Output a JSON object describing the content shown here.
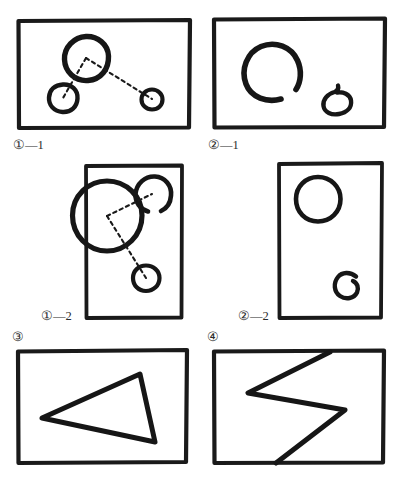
{
  "figure": {
    "title": "",
    "background_color": "#ffffff",
    "ink_color": "#1a1a1a",
    "panels": [
      {
        "id": "panel-1-1",
        "label": "①—1",
        "label_position": "below-left",
        "frame": {
          "x": 18,
          "y": 20,
          "width": 172,
          "height": 108,
          "orientation": "landscape"
        },
        "shapes": [
          {
            "kind": "circle",
            "name": "large-circle",
            "cx": 86,
            "cy": 58,
            "r": 22,
            "stroke_width": 5
          },
          {
            "kind": "circle",
            "name": "small-circle-left",
            "cx": 63,
            "cy": 98,
            "r": 14,
            "stroke_width": 4
          },
          {
            "kind": "circle",
            "name": "small-circle-right",
            "cx": 152,
            "cy": 99,
            "r": 10,
            "stroke_width": 4
          }
        ],
        "connectors": [
          {
            "kind": "dashed-line",
            "name": "connector-large-to-left",
            "x1": 86,
            "y1": 58,
            "x2": 63,
            "y2": 98
          },
          {
            "kind": "dashed-line",
            "name": "connector-large-to-right",
            "x1": 86,
            "y1": 58,
            "x2": 152,
            "y2": 99
          }
        ]
      },
      {
        "id": "panel-2-1",
        "label": "②—1",
        "label_position": "below-left",
        "frame": {
          "x": 213,
          "y": 18,
          "width": 172,
          "height": 110,
          "orientation": "landscape"
        },
        "shapes": [
          {
            "kind": "circle",
            "name": "large-open-circle",
            "cx": 272,
            "cy": 72,
            "r": 27,
            "stroke_width": 5,
            "open_gap_deg": 30
          },
          {
            "kind": "circle",
            "name": "small-open-circle",
            "cx": 337,
            "cy": 99,
            "r": 14,
            "stroke_width": 4,
            "open_gap_deg": 26
          }
        ],
        "connectors": []
      },
      {
        "id": "panel-1-2",
        "label": "①—2",
        "label_position": "bottom-left-outside",
        "frame": {
          "x": 85,
          "y": 165,
          "width": 97,
          "height": 153,
          "orientation": "portrait"
        },
        "shapes": [
          {
            "kind": "circle",
            "name": "large-circle-overlapping-edge",
            "cx": 107,
            "cy": 216,
            "r": 35,
            "stroke_width": 5
          },
          {
            "kind": "circle",
            "name": "upper-right-circle",
            "cx": 152,
            "cy": 194,
            "r": 18,
            "stroke_width": 4,
            "open_gap_deg": 30
          },
          {
            "kind": "circle",
            "name": "lower-right-circle",
            "cx": 146,
            "cy": 278,
            "r": 13,
            "stroke_width": 4
          }
        ],
        "connectors": [
          {
            "kind": "dashed-line",
            "name": "connector-large-to-upper",
            "x1": 107,
            "y1": 216,
            "x2": 152,
            "y2": 194
          },
          {
            "kind": "dashed-line",
            "name": "connector-large-to-lower",
            "x1": 107,
            "y1": 216,
            "x2": 146,
            "y2": 278
          }
        ]
      },
      {
        "id": "panel-2-2",
        "label": "②—2",
        "label_position": "bottom-left-outside",
        "frame": {
          "x": 278,
          "y": 163,
          "width": 104,
          "height": 155,
          "orientation": "portrait"
        },
        "shapes": [
          {
            "kind": "circle",
            "name": "upper-circle",
            "cx": 318,
            "cy": 199,
            "r": 22,
            "stroke_width": 4
          },
          {
            "kind": "circle",
            "name": "lower-open-circle",
            "cx": 351,
            "cy": 285,
            "r": 13,
            "stroke_width": 4,
            "open_gap_deg": 34
          }
        ],
        "connectors": []
      },
      {
        "id": "panel-3",
        "label": "③",
        "label_position": "above-left",
        "frame": {
          "x": 17,
          "y": 350,
          "width": 170,
          "height": 113,
          "orientation": "landscape"
        },
        "shapes": [
          {
            "kind": "polygon",
            "name": "triangle",
            "points": [
              [
                42,
                418
              ],
              [
                140,
                374
              ],
              [
                155,
                442
              ]
            ],
            "stroke_width": 5,
            "closed": true
          }
        ],
        "connectors": []
      },
      {
        "id": "panel-4",
        "label": "④",
        "label_position": "above-left",
        "frame": {
          "x": 213,
          "y": 350,
          "width": 171,
          "height": 114,
          "orientation": "landscape"
        },
        "shapes": [
          {
            "kind": "polyline",
            "name": "zigzag-chevron",
            "points": [
              [
                330,
                352
              ],
              [
                248,
                393
              ],
              [
                345,
                410
              ],
              [
                276,
                463
              ]
            ],
            "stroke_width": 5,
            "closed": false
          }
        ],
        "connectors": []
      }
    ]
  },
  "labels": {
    "panel_1_1": "①—1",
    "panel_2_1": "②—1",
    "panel_1_2": "①—2",
    "panel_2_2": "②—2",
    "panel_3": "③",
    "panel_4": "④"
  }
}
